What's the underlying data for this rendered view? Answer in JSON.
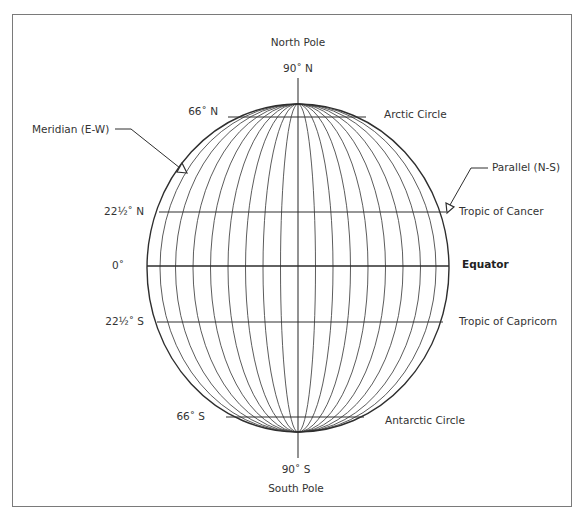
{
  "diagram": {
    "type": "globe-latitude-longitude",
    "top_labels": {
      "pole": "North Pole",
      "degree": "90˚ N"
    },
    "bottom_labels": {
      "degree": "90˚ S",
      "pole": "South Pole"
    },
    "latitude_labels_left": [
      {
        "id": "arctic",
        "text": "66˚ N"
      },
      {
        "id": "cancer",
        "text": "22½˚ N"
      },
      {
        "id": "equator",
        "text": "0˚"
      },
      {
        "id": "capricorn",
        "text": "22½˚ S"
      },
      {
        "id": "antarctic",
        "text": "66˚ S"
      }
    ],
    "latitude_names_right": [
      {
        "id": "arctic",
        "text": "Arctic Circle"
      },
      {
        "id": "cancer",
        "text": "Tropic of Cancer"
      },
      {
        "id": "equator",
        "text": "Equator"
      },
      {
        "id": "capricorn",
        "text": "Tropic of Capricorn"
      },
      {
        "id": "antarctic",
        "text": "Antarctic Circle"
      }
    ],
    "callouts": {
      "meridian": "Meridian (E-W)",
      "parallel": "Parallel (N-S)"
    },
    "colors": {
      "line": "#3a3a3a",
      "frame": "#7a7a7a",
      "background": "#ffffff"
    }
  }
}
